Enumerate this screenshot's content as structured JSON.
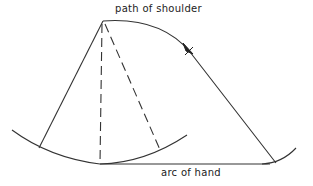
{
  "diagram": {
    "labels": {
      "path_of_shoulder": "path of shoulder",
      "arc_of_hand": "arc of hand"
    },
    "colors": {
      "line": "#333333",
      "background": "#ffffff"
    }
  }
}
